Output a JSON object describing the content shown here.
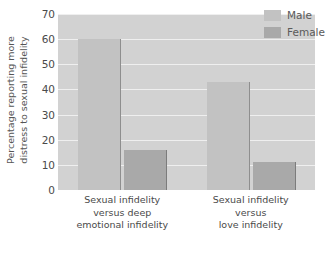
{
  "chart_data": {
    "type": "bar",
    "title": "",
    "subtitle": "",
    "xlabel": "",
    "ylabel": "Percentage reporting more distress to sexual infidelity",
    "ylabel_lines": [
      "Percentage reporting more",
      "distress to sexual infidelity"
    ],
    "ylim": [
      0,
      70
    ],
    "ytick_values": [
      0,
      10,
      20,
      30,
      40,
      50,
      60,
      70
    ],
    "ytick_labels": [
      "0",
      "10",
      "20",
      "30",
      "40",
      "50",
      "60",
      "70"
    ],
    "grid": true,
    "grid_axis": "y",
    "legend_position": "top-right",
    "categories": [
      "Sexual infidelity versus deep emotional infidelity",
      "Sexual infidelity versus love infidelity"
    ],
    "category_label_lines": [
      [
        "Sexual infidelity",
        "versus deep",
        "emotional infidelity"
      ],
      [
        "Sexual infidelity",
        "versus",
        "love infidelity"
      ]
    ],
    "series": [
      {
        "name": "Male",
        "color": "#c2c2c2",
        "values": [
          60,
          43
        ]
      },
      {
        "name": "Female",
        "color": "#a9a9a9",
        "values": [
          16,
          11
        ]
      }
    ],
    "plot_background": "#d2d2d2",
    "gridline_color": "#efefef"
  },
  "legend": {
    "entries": [
      {
        "label": "Male"
      },
      {
        "label": "Female"
      }
    ]
  }
}
